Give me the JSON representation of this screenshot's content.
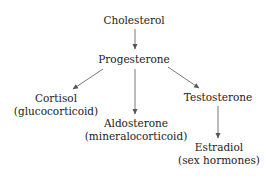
{
  "diagram": {
    "type": "flowchart",
    "nodes": [
      {
        "id": "cholesterol",
        "label": "Cholesterol",
        "sublabel": null
      },
      {
        "id": "progesterone",
        "label": "Progesterone",
        "sublabel": null
      },
      {
        "id": "cortisol",
        "label": "Cortisol",
        "sublabel": "(glucocorticoid)"
      },
      {
        "id": "aldosterone",
        "label": "Aldosterone",
        "sublabel": "(mineralocorticoid)"
      },
      {
        "id": "testosterone",
        "label": "Testosterone",
        "sublabel": null
      },
      {
        "id": "estradiol",
        "label": "Estradiol",
        "sublabel": "(sex hormones)"
      }
    ],
    "edges": [
      {
        "from": "cholesterol",
        "to": "progesterone"
      },
      {
        "from": "progesterone",
        "to": "cortisol"
      },
      {
        "from": "progesterone",
        "to": "aldosterone"
      },
      {
        "from": "progesterone",
        "to": "testosterone"
      },
      {
        "from": "testosterone",
        "to": "estradiol"
      }
    ],
    "colors": {
      "text": "#222222",
      "arrow": "#555555",
      "background": "#ffffff"
    }
  }
}
